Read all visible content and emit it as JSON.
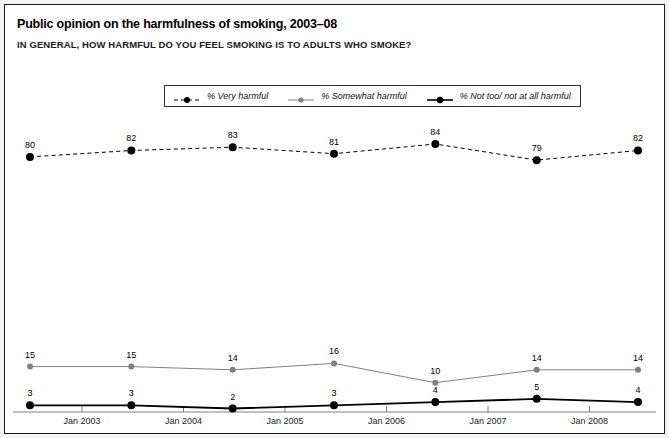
{
  "header": {
    "title": "Public opinion on the harmfulness of smoking, 2003–08",
    "subtitle": "IN GENERAL, HOW HARMFUL DO YOU FEEL SMOKING IS TO ADULTS WHO SMOKE?"
  },
  "colors": {
    "very_harmful": "#000000",
    "somewhat_harmful": "#808080",
    "not_harmful": "#000000",
    "axis": "#808080",
    "frame": "#1a1a1a",
    "background": "#ffffff",
    "page_background": "#f2f2f2"
  },
  "legend": {
    "position": "top-center",
    "entries": [
      {
        "label": "% Very harmful",
        "marker": "dashed-line-dot",
        "color": "#000000"
      },
      {
        "label": "% Somewhat harmful",
        "marker": "solid-line-dot",
        "color": "#808080"
      },
      {
        "label": "% Not too/ not at all harmful",
        "marker": "solid-bold-line-dot",
        "color": "#000000"
      }
    ]
  },
  "chart_data": {
    "type": "line",
    "title": "Public opinion on the harmfulness of smoking, 2003–08",
    "subtitle": "IN GENERAL, HOW HARMFUL DO YOU FEEL SMOKING IS TO ADULTS WHO SMOKE?",
    "xlabel": "",
    "ylabel": "",
    "ylim": [
      0,
      100
    ],
    "grid": false,
    "legend_position": "top-center",
    "categories": [
      "Jan 2003",
      "Jan 2004",
      "Jan 2005",
      "Jan 2006",
      "Jan 2007",
      "Jan 2008",
      "2008"
    ],
    "x_tick_labels": [
      "Jan 2003",
      "Jan 2004",
      "Jan 2005",
      "Jan 2006",
      "Jan 2007",
      "Jan 2008"
    ],
    "series": [
      {
        "name": "% Very harmful",
        "color": "#000000",
        "style": "dashed",
        "values": [
          80,
          82,
          83,
          81,
          84,
          79,
          82
        ]
      },
      {
        "name": "% Somewhat harmful",
        "color": "#808080",
        "style": "solid",
        "values": [
          15,
          15,
          14,
          16,
          10,
          14,
          14
        ]
      },
      {
        "name": "% Not too/ not at all harmful",
        "color": "#000000",
        "style": "solid-bold",
        "values": [
          3,
          3,
          2,
          3,
          4,
          5,
          4
        ]
      }
    ]
  }
}
